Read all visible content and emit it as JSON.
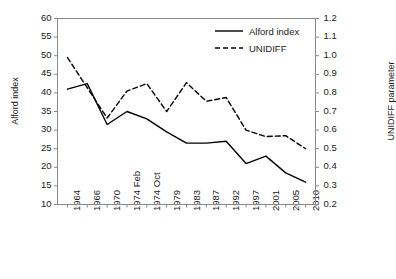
{
  "chart_data": {
    "type": "line",
    "title": "",
    "xlabel": "",
    "categories": [
      "1964",
      "1966",
      "1970",
      "1974 Feb",
      "1974 Oct",
      "1979",
      "1983",
      "1987",
      "1992",
      "1997",
      "2001",
      "2005",
      "2010"
    ],
    "grid": false,
    "legend_position": "top-right",
    "axes": {
      "left": {
        "label": "Alford index",
        "ylim": [
          10,
          60
        ],
        "ticks": [
          10,
          15,
          20,
          25,
          30,
          35,
          40,
          45,
          50,
          55,
          60
        ],
        "tick_labels": [
          "10",
          "15",
          "20",
          "25",
          "30",
          "35",
          "40",
          "45",
          "50",
          "55",
          "60"
        ]
      },
      "right": {
        "label": "UNIDIFF parameter",
        "ylim": [
          0.2,
          1.2
        ],
        "ticks": [
          0.2,
          0.3,
          0.4,
          0.5,
          0.6,
          0.7,
          0.8,
          0.9,
          1.0,
          1.1,
          1.2
        ],
        "tick_labels": [
          "0.2",
          "0.3",
          "0.4",
          "0.5",
          "0.6",
          "0.7",
          "0.8",
          "0.9",
          "1.0",
          "1.1",
          "1.2"
        ]
      }
    },
    "series": [
      {
        "name": "Alford index",
        "axis": "left",
        "style": "solid",
        "color": "#000000",
        "x": [
          "1964",
          "1966",
          "1970",
          "1974 Feb",
          "1974 Oct",
          "1979",
          "1983",
          "1987",
          "1992",
          "1997",
          "2001",
          "2005",
          "2010"
        ],
        "values": [
          41,
          42.5,
          31.5,
          35,
          33,
          29.5,
          26.5,
          26.5,
          27,
          21,
          23,
          18.5,
          16
        ]
      },
      {
        "name": "UNIDIFF",
        "axis": "right",
        "style": "dashed",
        "color": "#000000",
        "x": [
          "1964",
          "1970",
          "1974 Feb",
          "1974 Oct",
          "1979",
          "1983",
          "1987",
          "1992",
          "1997",
          "2001",
          "2005",
          "2010"
        ],
        "values": [
          0.99,
          0.665,
          0.81,
          0.85,
          0.7,
          0.855,
          0.755,
          0.775,
          0.6,
          0.565,
          0.57,
          0.5
        ]
      }
    ],
    "legend": [
      {
        "label": "Alford index",
        "style": "solid"
      },
      {
        "label": "UNIDIFF",
        "style": "dashed"
      }
    ]
  }
}
